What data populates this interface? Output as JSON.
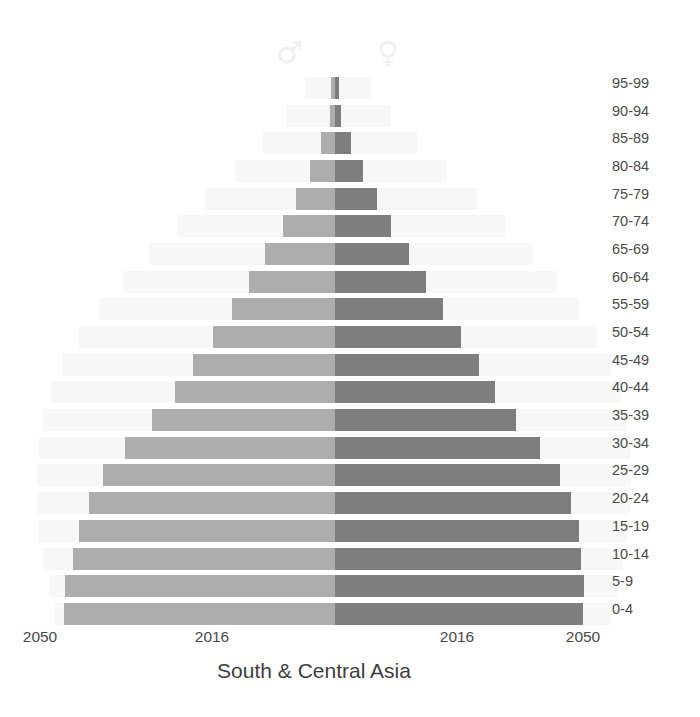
{
  "chart": {
    "title": "South & Central Asia",
    "legend": {
      "male_symbol": "♂",
      "female_symbol": "♀"
    },
    "x_ticks": [
      {
        "label": "2050",
        "x": 40
      },
      {
        "label": "2016",
        "x": 212
      },
      {
        "label": "2016",
        "x": 457
      },
      {
        "label": "2050",
        "x": 583
      }
    ],
    "colors": {
      "male_2016": "#adadad",
      "female_2016": "#7e7e7e",
      "projection_2050": "#f7f7f7",
      "background": "#ffffff",
      "text": "#4a4a4a",
      "symbol": "#f0f0f0"
    }
  },
  "chart_data": {
    "type": "bar",
    "subtype": "population-pyramid",
    "title": "South & Central Asia",
    "xlabel": "",
    "ylabel": "",
    "grid": false,
    "legend_position": "top",
    "axis_orientation": "horizontal-diverging",
    "center_x_px": 335,
    "x_tick_labels": [
      "2050",
      "2016",
      "2016",
      "2050"
    ],
    "categories": [
      "95-99",
      "90-94",
      "85-89",
      "80-84",
      "75-79",
      "70-74",
      "65-69",
      "60-64",
      "55-59",
      "50-54",
      "45-49",
      "40-44",
      "35-39",
      "30-34",
      "25-29",
      "20-24",
      "15-19",
      "10-14",
      "5-9",
      "0-4"
    ],
    "series": [
      {
        "name": "Male 2016",
        "side": "left",
        "color": "#adadad",
        "values_px": [
          4,
          5,
          14,
          25,
          39,
          52,
          70,
          86,
          103,
          122,
          142,
          160,
          183,
          210,
          232,
          246,
          256,
          262,
          270,
          271
        ]
      },
      {
        "name": "Female 2016",
        "side": "right",
        "color": "#7e7e7e",
        "values_px": [
          4,
          6,
          16,
          28,
          42,
          56,
          74,
          91,
          108,
          126,
          144,
          160,
          181,
          205,
          225,
          236,
          244,
          246,
          249,
          248
        ]
      },
      {
        "name": "Male 2050 (projection)",
        "side": "left",
        "color": "#f7f7f7",
        "values_px": [
          30,
          48,
          72,
          100,
          130,
          158,
          186,
          212,
          236,
          256,
          272,
          284,
          292,
          296,
          298,
          298,
          296,
          292,
          286,
          280
        ]
      },
      {
        "name": "Female 2050 (projection)",
        "side": "right",
        "color": "#f7f7f7",
        "values_px": [
          36,
          56,
          82,
          112,
          142,
          170,
          198,
          222,
          244,
          262,
          276,
          286,
          292,
          295,
          296,
          295,
          292,
          288,
          282,
          276
        ]
      }
    ],
    "row_geometry": {
      "row_height_px": 27.7,
      "bar_height_px": 22
    }
  }
}
